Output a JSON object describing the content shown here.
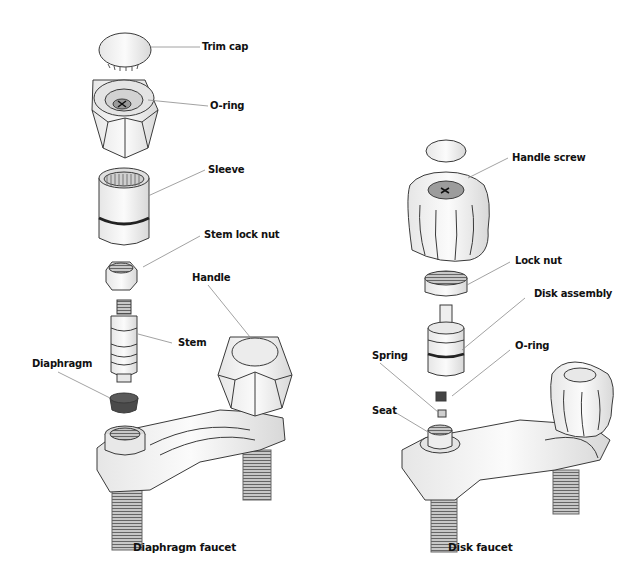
{
  "diagrams": [
    {
      "title": "Diaphragm faucet",
      "parts": [
        {
          "label": "Trim cap"
        },
        {
          "label": "O-ring"
        },
        {
          "label": "Sleeve"
        },
        {
          "label": "Stem lock nut"
        },
        {
          "label": "Handle"
        },
        {
          "label": "Stem"
        },
        {
          "label": "Diaphragm"
        }
      ]
    },
    {
      "title": "Disk faucet",
      "parts": [
        {
          "label": "Handle screw"
        },
        {
          "label": "Lock nut"
        },
        {
          "label": "Disk assembly"
        },
        {
          "label": "O-ring"
        },
        {
          "label": "Spring"
        },
        {
          "label": "Seat"
        }
      ]
    }
  ],
  "colors": {
    "outline": "#3a3a3a",
    "part_fill": "#f2f2f2",
    "shade": "#d4d4d4",
    "dark_part": "#4a4a4a",
    "leader_line": "#8a8a8a"
  }
}
